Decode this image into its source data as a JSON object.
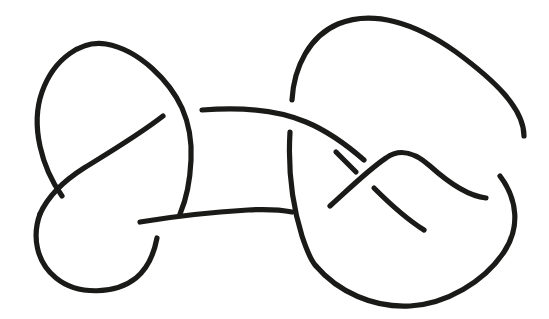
{
  "figure": {
    "title": "Knot diagram",
    "kind": "line-drawing",
    "background_color": "#ffffff",
    "stroke_color": "#1a1a18",
    "canvas": {
      "width": 549,
      "height": 319
    },
    "crossing_count": 8,
    "component_count": 1
  },
  "chart_data": {
    "type": "line",
    "title": "Knot diagram",
    "xlabel": "",
    "ylabel": "",
    "xlim": [
      0,
      549
    ],
    "ylim": [
      0,
      319
    ],
    "grid": false,
    "legend": "none",
    "stroke_width": 5.2,
    "strands": [
      {
        "name": "left-upper-loop",
        "note": "Large top-left oval lobe; starts lower-left, arcs up over the apex and descends on the right into the left-lower region.",
        "d": "M 62 196 C 42 168 30 126 42 92 C 54 58 82 40 106 44 C 140 50 170 82 182 108 C 190 126 192 142 191 160 C 190 182 186 200 180 214"
      },
      {
        "name": "upper-left-diagonal-over",
        "note": "Strand crossing over at the left crossing, running from upper-right down to lower-left; passes OVER the left-lobe strand.",
        "d": "M 163 116 C 140 134 110 152 84 168 C 62 182 48 196 40 214"
      },
      {
        "name": "left-lower-loop",
        "note": "Bottom-left lobe; continues from the left crossing down and around the bottom and back up to the right ending below the lower connector.",
        "d": "M 40 214 C 32 236 36 262 56 278 C 78 296 116 294 136 278 C 148 268 154 254 157 238"
      },
      {
        "name": "upper-connector",
        "note": "Long upper near-horizontal strand from the left lobe across to the right lobe; starts after a break (passes UNDER the left lobe's descending strand) and passes OVER the right lobe's left descending strand.",
        "d": "M 202 110 C 240 107 278 110 306 122 C 330 132 348 146 364 160"
      },
      {
        "name": "lower-connector",
        "note": "Long lower near-horizontal strand from the left lobe across to the right; it passes OVER the left lobe's lower strand and ends at a break before the right lobe's arc.",
        "d": "M 140 222 C 176 216 214 212 248 210 C 266 209 282 210 292 212"
      },
      {
        "name": "right-upper-loop",
        "note": "Large top-right lobe; rises from lower-left up over the apex and sweeps down the far right side.",
        "d": "M 292 100 C 294 66 310 36 338 24 C 372 10 414 22 456 52 C 494 80 524 108 524 136"
      },
      {
        "name": "right-inner-hook-over",
        "note": "Inner hooked strand in the right lobe forming the peak near x=400; crosses OVER at the right crossing.",
        "d": "M 330 206 C 348 190 368 170 386 158 C 400 148 414 152 430 166 C 450 184 468 196 486 198"
      },
      {
        "name": "right-outer-descending",
        "note": "Far-right strand descending from the outer arc after a break, curving down and left along the bottom-right lobe.",
        "d": "M 500 176 C 518 200 520 228 504 252 C 484 282 446 304 410 306 C 374 308 338 292 316 266"
      },
      {
        "name": "right-lobe-left-arc-over",
        "note": "Long left-hand arc of the right lobe, passing OVER the lower connector and continuing down to the bottom-right lobe.",
        "d": "M 290 132 C 288 166 292 204 302 236 C 308 254 312 262 316 266"
      },
      {
        "name": "right-crossing-short-upper",
        "note": "Short strand segment entering the right crossing from the upper left, broken where it passes UNDER the inner hook.",
        "d": "M 336 152 C 344 160 350 166 356 172"
      },
      {
        "name": "right-crossing-short-lower",
        "note": "Short strand segment leaving the right crossing toward the lower right, resuming after the under-break.",
        "d": "M 374 188 C 392 206 408 220 424 230"
      }
    ],
    "crossings": [
      {
        "id": 1,
        "x": 94,
        "y": 160,
        "over": "upper-left-diagonal-over",
        "under": "left-upper-loop"
      },
      {
        "id": 2,
        "x": 191,
        "y": 112,
        "over": "left-upper-loop",
        "under": "upper-connector"
      },
      {
        "id": 3,
        "x": 168,
        "y": 218,
        "over": "lower-connector",
        "under": "left-lower-loop"
      },
      {
        "id": 4,
        "x": 290,
        "y": 112,
        "over": "upper-connector",
        "under": "right-lobe-left-arc-over"
      },
      {
        "id": 5,
        "x": 303,
        "y": 212,
        "over": "right-lobe-left-arc-over",
        "under": "lower-connector"
      },
      {
        "id": 6,
        "x": 366,
        "y": 180,
        "over": "right-inner-hook-over",
        "under": "right-crossing-short-upper"
      },
      {
        "id": 7,
        "x": 493,
        "y": 166,
        "over": "right-inner-hook-over",
        "under": "right-outer-descending"
      },
      {
        "id": 8,
        "x": 320,
        "y": 196,
        "over": "right-lobe-left-arc-over",
        "under": "right-inner-hook-over"
      }
    ]
  }
}
